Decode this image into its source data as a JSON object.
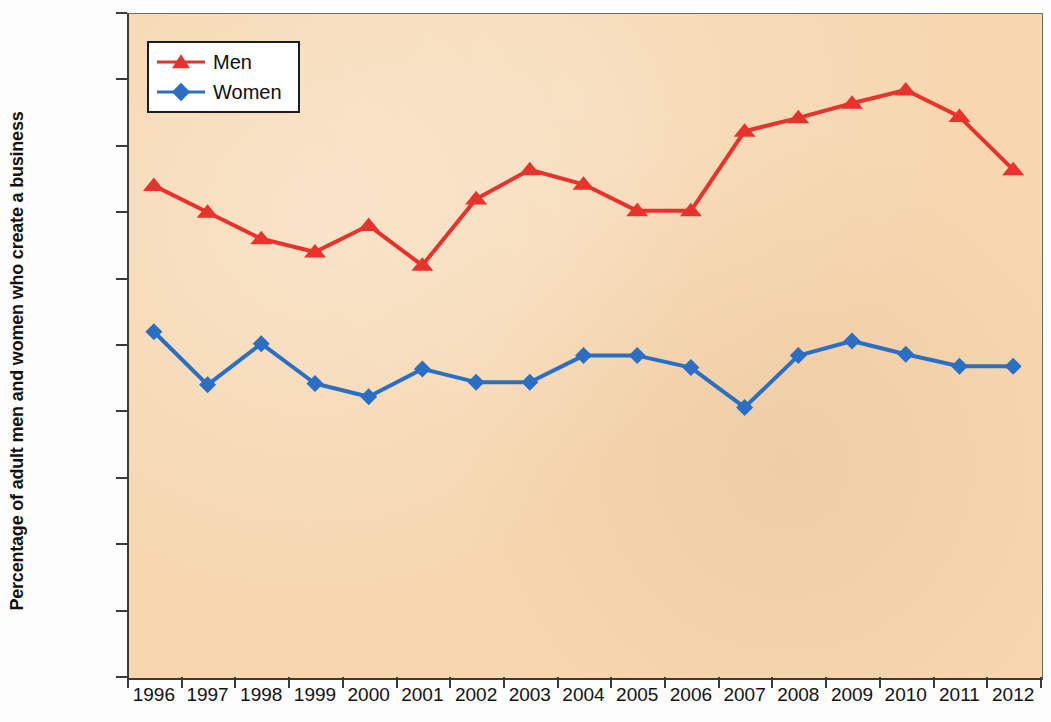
{
  "chart_data": {
    "type": "line",
    "title": "",
    "subtitle": "",
    "xlabel": "",
    "ylabel": "Percentage of adult men and women who create a business",
    "categories": [
      "1996",
      "1997",
      "1998",
      "1999",
      "2000",
      "2001",
      "2002",
      "2003",
      "2004",
      "2005",
      "2006",
      "2007",
      "2008",
      "2009",
      "2010",
      "2011",
      "2012"
    ],
    "x": [
      1996,
      1997,
      1998,
      1999,
      2000,
      2001,
      2002,
      2003,
      2004,
      2005,
      2006,
      2007,
      2008,
      2009,
      2010,
      2011,
      2012
    ],
    "series": [
      {
        "name": "Men",
        "color": "#e8322c",
        "marker": "triangle",
        "values": [
          0.37,
          0.35,
          0.33,
          0.32,
          0.34,
          0.31,
          0.36,
          0.382,
          0.371,
          0.351,
          0.351,
          0.411,
          0.421,
          0.432,
          0.442,
          0.422,
          0.382
        ]
      },
      {
        "name": "Women",
        "color": "#2b6fc4",
        "marker": "diamond",
        "values": [
          0.26,
          0.22,
          0.251,
          0.221,
          0.211,
          0.232,
          0.222,
          0.222,
          0.242,
          0.242,
          0.233,
          0.203,
          0.242,
          0.253,
          0.243,
          0.234,
          0.234
        ]
      }
    ],
    "ylim": [
      0.0,
      0.5
    ],
    "yticks": [
      0.0,
      0.05,
      0.1,
      0.15,
      0.2,
      0.25,
      0.3,
      0.35,
      0.4,
      0.45,
      0.5
    ],
    "ytick_labels": [
      "0.00%",
      "0.05%",
      "0.10%",
      "0.15%",
      "0.20%",
      "0.25%",
      "0.30%",
      "0.35%",
      "0.40%",
      "0.45%",
      "0.50%"
    ],
    "grid": false,
    "legend_position": "upper left",
    "units": "%",
    "plot_background_color": "#f6d7b0",
    "axis_color": "#3a3a38"
  },
  "legend": {
    "entries": [
      {
        "label": "Men"
      },
      {
        "label": "Women"
      }
    ]
  }
}
